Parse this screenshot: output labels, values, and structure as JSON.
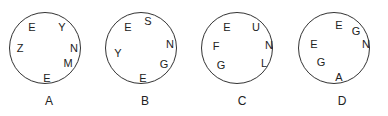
{
  "figures": [
    {
      "label": "A",
      "center": [
        45,
        48
      ],
      "letters": [
        {
          "char": "E",
          "x": 32,
          "y": 27
        },
        {
          "char": "Y",
          "x": 62,
          "y": 27
        },
        {
          "char": "Z",
          "x": 20,
          "y": 48
        },
        {
          "char": "N",
          "x": 74,
          "y": 48
        },
        {
          "char": "M",
          "x": 68,
          "y": 63
        },
        {
          "char": "E",
          "x": 47,
          "y": 78
        }
      ],
      "label_pos": [
        49,
        101
      ]
    },
    {
      "label": "B",
      "center": [
        141,
        48
      ],
      "letters": [
        {
          "char": "E",
          "x": 128,
          "y": 27
        },
        {
          "char": "S",
          "x": 148,
          "y": 21
        },
        {
          "char": "N",
          "x": 170,
          "y": 44
        },
        {
          "char": "Y",
          "x": 118,
          "y": 53
        },
        {
          "char": "G",
          "x": 164,
          "y": 64
        },
        {
          "char": "E",
          "x": 143,
          "y": 78
        }
      ],
      "label_pos": [
        145,
        101
      ]
    },
    {
      "label": "C",
      "center": [
        237,
        48
      ],
      "letters": [
        {
          "char": "E",
          "x": 227,
          "y": 27
        },
        {
          "char": "U",
          "x": 256,
          "y": 27
        },
        {
          "char": "F",
          "x": 216,
          "y": 46
        },
        {
          "char": "N",
          "x": 269,
          "y": 45
        },
        {
          "char": "G",
          "x": 221,
          "y": 65
        },
        {
          "char": "L",
          "x": 264,
          "y": 63
        }
      ],
      "label_pos": [
        242,
        101
      ]
    },
    {
      "label": "D",
      "center": [
        334,
        48
      ],
      "letters": [
        {
          "char": "E",
          "x": 339,
          "y": 25
        },
        {
          "char": "G",
          "x": 356,
          "y": 31
        },
        {
          "char": "N",
          "x": 366,
          "y": 44
        },
        {
          "char": "E",
          "x": 314,
          "y": 44
        },
        {
          "char": "G",
          "x": 321,
          "y": 62
        },
        {
          "char": "A",
          "x": 339,
          "y": 77
        }
      ],
      "label_pos": [
        342,
        101
      ]
    }
  ]
}
